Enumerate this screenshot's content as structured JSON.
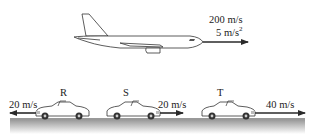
{
  "airplane": {
    "velocity_label": "200 m/s",
    "acceleration_value": "5 m/s",
    "acceleration_exponent": "2",
    "direction": "right"
  },
  "cars": [
    {
      "label": "R",
      "velocity_label": "20 m/s",
      "direction": "left"
    },
    {
      "label": "S",
      "velocity_label": "20 m/s",
      "direction": "right"
    },
    {
      "label": "T",
      "velocity_label": "40 m/s",
      "direction": "right"
    }
  ],
  "colors": {
    "line": "#2a2a2a",
    "road": "#8a8a8a",
    "background": "#ffffff"
  }
}
